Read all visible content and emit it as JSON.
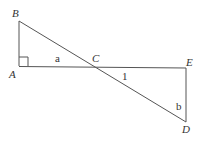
{
  "diagram": {
    "points": {
      "A": {
        "label": "A",
        "x": 19,
        "y": 66
      },
      "B": {
        "label": "B",
        "x": 19,
        "y": 21
      },
      "C": {
        "label": "C",
        "x": 94,
        "y": 67
      },
      "D": {
        "label": "D",
        "x": 186,
        "y": 122
      },
      "E": {
        "label": "E",
        "x": 186,
        "y": 68
      }
    },
    "angle_labels": {
      "a": "a",
      "one": "1",
      "b": "b"
    },
    "segments": [
      "AB",
      "AE",
      "BD",
      "ED"
    ],
    "right_angle_at": "A",
    "line_color": "#555555",
    "text_color": "#333333"
  }
}
